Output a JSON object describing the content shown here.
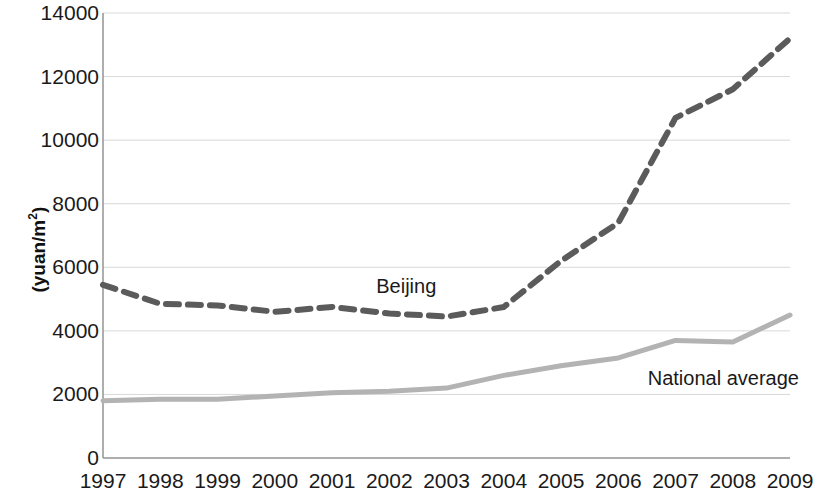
{
  "chart_data": {
    "type": "line",
    "title": "",
    "xlabel": "",
    "ylabel": "(yuan/m2)",
    "ylabel_base": "(yuan/m",
    "ylabel_sup": "2",
    "ylabel_close": ")",
    "categories": [
      "1997",
      "1998",
      "1999",
      "2000",
      "2001",
      "2002",
      "2003",
      "2004",
      "2005",
      "2006",
      "2007",
      "2008",
      "2009"
    ],
    "ylim": [
      0,
      14000
    ],
    "ytick_values": [
      "0",
      "2000",
      "4000",
      "6000",
      "8000",
      "10000",
      "12000",
      "14000"
    ],
    "grid": true,
    "grid_color": "#d9d9d9",
    "legend": "inline-labels",
    "series": [
      {
        "name": "Beijing",
        "style": "dashed",
        "color": "#5b5b5b",
        "width": 6,
        "values": [
          5450,
          4850,
          4800,
          4600,
          4750,
          4550,
          4450,
          4750,
          6200,
          7400,
          10700,
          11600,
          13200
        ]
      },
      {
        "name": "National average",
        "style": "solid",
        "color": "#b3b3b3",
        "width": 5,
        "values": [
          1800,
          1850,
          1850,
          1950,
          2050,
          2100,
          2200,
          2600,
          2900,
          3150,
          3700,
          3650,
          4500
        ]
      }
    ],
    "annotations": [
      {
        "text": "Beijing",
        "x_year": "2002",
        "y_value": 5500
      },
      {
        "text": "National average",
        "x_year": "2008",
        "y_value": 2550
      }
    ]
  },
  "axes": {
    "x_left_px": 103,
    "x_right_px": 790,
    "y_top_px": 13,
    "y_bottom_px": 458
  }
}
